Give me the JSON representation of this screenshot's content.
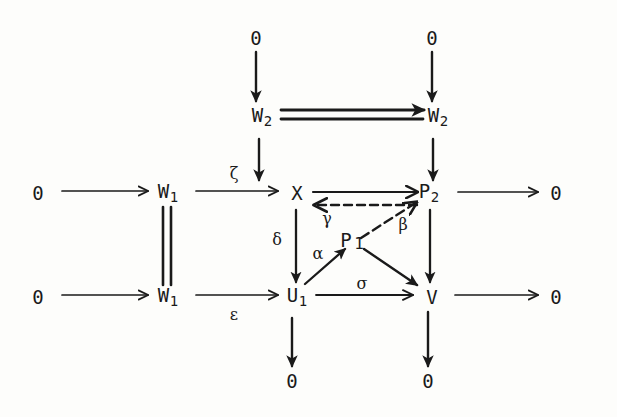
{
  "figure": {
    "kind": "commutative-diagram",
    "background_color": "#fdfdfb",
    "ink_color": "#1a1a1a",
    "width": 617,
    "height": 417
  },
  "nodes": [
    {
      "id": "zero_top_left",
      "label": "0",
      "sub": "",
      "x": 256,
      "y": 38
    },
    {
      "id": "zero_top_right",
      "label": "0",
      "sub": "",
      "x": 432,
      "y": 38
    },
    {
      "id": "w2_left",
      "label": "W",
      "sub": "2",
      "x": 262,
      "y": 117
    },
    {
      "id": "w2_right",
      "label": "W",
      "sub": "2",
      "x": 438,
      "y": 117
    },
    {
      "id": "zero_row1_left",
      "label": "0",
      "sub": "",
      "x": 38,
      "y": 193
    },
    {
      "id": "w1_upper",
      "label": "W",
      "sub": "1",
      "x": 168,
      "y": 193
    },
    {
      "id": "x_node",
      "label": "X",
      "sub": "",
      "x": 297,
      "y": 193
    },
    {
      "id": "p2_node",
      "label": "P",
      "sub": "2",
      "x": 429,
      "y": 193
    },
    {
      "id": "zero_row1_right",
      "label": "0",
      "sub": "",
      "x": 556,
      "y": 193
    },
    {
      "id": "p1_node",
      "label": "P",
      "sub": "1",
      "x": 352,
      "y": 242
    },
    {
      "id": "zero_row2_left",
      "label": "0",
      "sub": "",
      "x": 38,
      "y": 297
    },
    {
      "id": "w1_lower",
      "label": "W",
      "sub": "1",
      "x": 168,
      "y": 297
    },
    {
      "id": "u1_node",
      "label": "U",
      "sub": "1",
      "x": 297,
      "y": 297
    },
    {
      "id": "v_node",
      "label": "V",
      "sub": "",
      "x": 432,
      "y": 297
    },
    {
      "id": "zero_row2_right",
      "label": "0",
      "sub": "",
      "x": 556,
      "y": 297
    },
    {
      "id": "zero_bottom_left",
      "label": "0",
      "sub": "",
      "x": 292,
      "y": 381
    },
    {
      "id": "zero_bottom_right",
      "label": "0",
      "sub": "",
      "x": 428,
      "y": 381
    }
  ],
  "arrow_labels": [
    {
      "id": "zeta",
      "text": "ζ",
      "x": 234,
      "y": 174
    },
    {
      "id": "epsilon",
      "text": "ε",
      "x": 234,
      "y": 315
    },
    {
      "id": "delta",
      "text": "δ",
      "x": 277,
      "y": 240
    },
    {
      "id": "gamma",
      "text": "γ",
      "x": 327,
      "y": 219
    },
    {
      "id": "beta",
      "text": "β",
      "x": 403,
      "y": 225
    },
    {
      "id": "alpha",
      "text": "α",
      "x": 318,
      "y": 254
    },
    {
      "id": "sigma",
      "text": "σ",
      "x": 362,
      "y": 284
    }
  ],
  "edges": [
    {
      "id": "zero-to-w2-left",
      "from": "zero_top_left",
      "to": "w2_left",
      "style": "solid",
      "label": ""
    },
    {
      "id": "zero-to-w2-right",
      "from": "zero_top_right",
      "to": "w2_right",
      "style": "solid",
      "label": ""
    },
    {
      "id": "w2-equals-w2",
      "from": "w2_left",
      "to": "w2_right",
      "style": "double",
      "label": ""
    },
    {
      "id": "w2-to-x",
      "from": "w2_left",
      "to": "x_node",
      "style": "solid",
      "label": ""
    },
    {
      "id": "w2-to-p2",
      "from": "w2_right",
      "to": "p2_node",
      "style": "solid",
      "label": ""
    },
    {
      "id": "zero-to-w1-upper",
      "from": "zero_row1_left",
      "to": "w1_upper",
      "style": "solid",
      "label": ""
    },
    {
      "id": "w1-to-x",
      "from": "w1_upper",
      "to": "x_node",
      "style": "solid",
      "label": "ζ"
    },
    {
      "id": "x-to-p2",
      "from": "x_node",
      "to": "p2_node",
      "style": "solid",
      "label": ""
    },
    {
      "id": "p2-to-x",
      "from": "p2_node",
      "to": "x_node",
      "style": "dashed",
      "label": "γ"
    },
    {
      "id": "p2-to-zero",
      "from": "p2_node",
      "to": "zero_row1_right",
      "style": "solid",
      "label": ""
    },
    {
      "id": "w1-equals-w1",
      "from": "w1_upper",
      "to": "w1_lower",
      "style": "double",
      "label": ""
    },
    {
      "id": "x-to-u1",
      "from": "x_node",
      "to": "u1_node",
      "style": "solid",
      "label": "δ"
    },
    {
      "id": "p2-to-v",
      "from": "p2_node",
      "to": "v_node",
      "style": "solid",
      "label": ""
    },
    {
      "id": "p1-to-p2",
      "from": "p1_node",
      "to": "p2_node",
      "style": "dashed",
      "label": "β"
    },
    {
      "id": "u1-to-p1",
      "from": "u1_node",
      "to": "p1_node",
      "style": "solid",
      "label": "α"
    },
    {
      "id": "p1-to-v",
      "from": "p1_node",
      "to": "v_node",
      "style": "solid",
      "label": ""
    },
    {
      "id": "zero-to-w1-lower",
      "from": "zero_row2_left",
      "to": "w1_lower",
      "style": "solid",
      "label": ""
    },
    {
      "id": "w1-to-u1",
      "from": "w1_lower",
      "to": "u1_node",
      "style": "solid",
      "label": "ε"
    },
    {
      "id": "u1-to-v",
      "from": "u1_node",
      "to": "v_node",
      "style": "solid",
      "label": "σ"
    },
    {
      "id": "v-to-zero",
      "from": "v_node",
      "to": "zero_row2_right",
      "style": "solid",
      "label": ""
    },
    {
      "id": "u1-to-zero",
      "from": "u1_node",
      "to": "zero_bottom_left",
      "style": "solid",
      "label": ""
    },
    {
      "id": "v-to-zero-bottom",
      "from": "v_node",
      "to": "zero_bottom_right",
      "style": "solid",
      "label": ""
    }
  ]
}
